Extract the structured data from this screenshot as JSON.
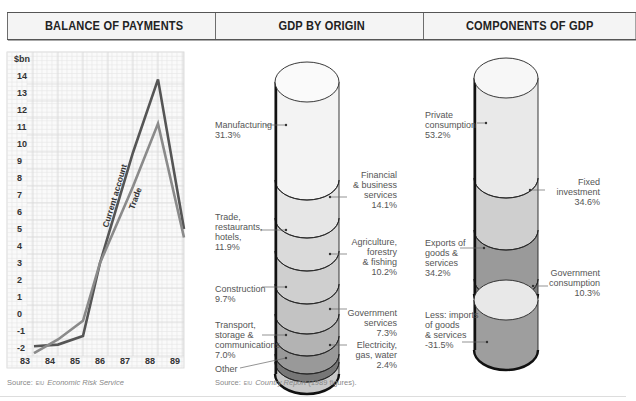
{
  "panels": {
    "bop": {
      "title": "BALANCE OF PAYMENTS",
      "source_prefix": "Source:",
      "source_logo": "EIU",
      "source_name": "Economic Risk Service"
    },
    "origin": {
      "title": "GDP BY ORIGIN",
      "source_prefix": "Source:",
      "source_logo": "EIU",
      "source_name": "Country Report",
      "source_suffix": "(1989 figures)."
    },
    "components": {
      "title": "COMPONENTS OF GDP"
    }
  },
  "labels": {
    "origin": {
      "manufacturing": [
        "Manufacturing",
        "31.3%"
      ],
      "financial": [
        "Financial",
        "& business",
        "services",
        "14.1%"
      ],
      "trade": [
        "Trade,",
        "restaurants,",
        "hotels,",
        "11.9%"
      ],
      "agriculture": [
        "Agriculture,",
        "forestry",
        "& fishing",
        "10.2%"
      ],
      "construction": [
        "Construction",
        "9.7%"
      ],
      "government": [
        "Government",
        "services",
        "7.3%"
      ],
      "transport": [
        "Transport,",
        "storage &",
        "communications",
        "7.0%"
      ],
      "electricity": [
        "Electricity,",
        "gas, water",
        "2.4%"
      ],
      "other": [
        "Other"
      ]
    },
    "components": {
      "private": [
        "Private",
        "consumption",
        "53.2%"
      ],
      "fixed": [
        "Fixed",
        "investment",
        "34.6%"
      ],
      "exports": [
        "Exports of",
        "goods &",
        "services",
        "34.2%"
      ],
      "government": [
        "Government",
        "consumption",
        "10.3%"
      ],
      "imports": [
        "Less: imports",
        "of goods",
        "& services",
        "-31.5%"
      ]
    }
  },
  "chart_data": [
    {
      "type": "line",
      "title": "BALANCE OF PAYMENTS",
      "ylabel": "$bn",
      "xlabel": "",
      "categories": [
        "83",
        "84",
        "85",
        "86",
        "87",
        "88",
        "89"
      ],
      "y_ticks": [
        14,
        13,
        12,
        11,
        10,
        9,
        8,
        7,
        6,
        5,
        4,
        3,
        2,
        1,
        0,
        -1,
        -2
      ],
      "ylim": [
        -2.5,
        15
      ],
      "grid": true,
      "series": [
        {
          "name": "Current account",
          "color": "#555555",
          "values": [
            -1.9,
            -1.8,
            -1.3,
            3.0,
            9.5,
            13.8,
            5.0
          ]
        },
        {
          "name": "Trade",
          "color": "#8a8a8a",
          "values": [
            -2.3,
            -1.5,
            -0.4,
            3.0,
            7.5,
            11.2,
            4.5
          ]
        }
      ],
      "source": "Source: EIU Economic Risk Service"
    },
    {
      "type": "bar",
      "subtype": "stacked-cylinder",
      "title": "GDP BY ORIGIN",
      "categories": [
        "Manufacturing",
        "Financial & business services",
        "Trade, restaurants, hotels",
        "Agriculture, forestry & fishing",
        "Construction",
        "Government services",
        "Transport, storage & communications",
        "Electricity, gas, water",
        "Other"
      ],
      "values": [
        31.3,
        14.1,
        11.9,
        10.2,
        9.7,
        7.3,
        7.0,
        2.4,
        6.1
      ],
      "unit": "%",
      "source": "Source: EIU Country Report (1989 figures)."
    },
    {
      "type": "bar",
      "subtype": "stacked-cylinder",
      "title": "COMPONENTS OF GDP",
      "categories": [
        "Private consumption",
        "Fixed investment",
        "Exports of goods & services",
        "Government consumption",
        "Less: imports of goods & services"
      ],
      "values": [
        53.2,
        34.6,
        34.2,
        10.3,
        -31.5
      ],
      "unit": "%"
    }
  ]
}
